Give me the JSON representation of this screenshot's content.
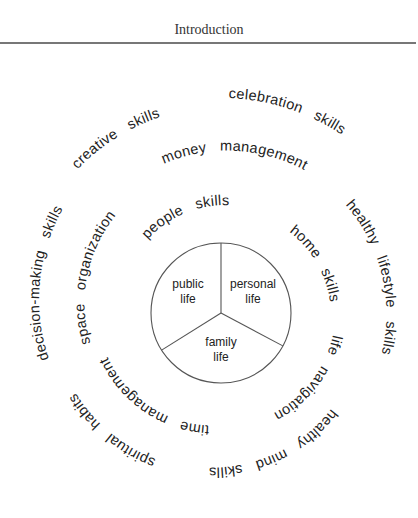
{
  "header": {
    "title": "Introduction"
  },
  "diagram": {
    "center": [
      221,
      313
    ],
    "pie": {
      "radius": 70,
      "divider_angles_deg": [
        0,
        118,
        238
      ],
      "stroke": "#555555",
      "segments": [
        {
          "lines": [
            "public",
            "life"
          ],
          "pos": [
            188,
            288
          ]
        },
        {
          "lines": [
            "personal",
            "life"
          ],
          "pos": [
            253,
            288
          ]
        },
        {
          "lines": [
            "family",
            "life"
          ],
          "pos": [
            221,
            346
          ]
        }
      ]
    },
    "rings": [
      {
        "name": "inner",
        "phrases": [
          {
            "text": "people   skills",
            "r": 104,
            "start_deg": -45,
            "r_end": 112
          },
          {
            "text": "home   skills",
            "r": 106,
            "start_deg": 40,
            "r_end": 114
          },
          {
            "text": "life   navigation",
            "r": 114,
            "start_deg": 101,
            "r_end": 112
          },
          {
            "text": "time   management",
            "r": 113,
            "start_deg": 186,
            "r_end": 126
          },
          {
            "text": "space   organization",
            "r": 134,
            "start_deg": 257,
            "r_end": 150
          }
        ]
      },
      {
        "name": "middle",
        "phrases": [
          {
            "text": "money   management",
            "r": 160,
            "start_deg": -21,
            "r_end": 170
          },
          {
            "text": "healthy   lifestyle   skills",
            "r": 165,
            "start_deg": 49,
            "r_end": 166
          },
          {
            "text": "healthy   mind   skills",
            "r": 146,
            "start_deg": 131,
            "r_end": 162
          },
          {
            "text": "spiritual   habits",
            "r": 160,
            "start_deg": 204,
            "r_end": 175
          },
          {
            "text": "decision-making   skills",
            "r": 178,
            "start_deg": 255,
            "r_end": 200
          }
        ]
      },
      {
        "name": "outer",
        "phrases": [
          {
            "text": "creative   skills",
            "r": 203,
            "start_deg": 315,
            "r_end": 211
          },
          {
            "text": "celebration   skills",
            "r": 215,
            "start_deg": 2,
            "r_end": 216
          }
        ]
      }
    ]
  }
}
